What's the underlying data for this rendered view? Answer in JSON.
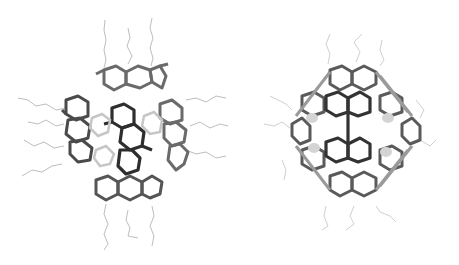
{
  "figure": {
    "background": "#ffffff",
    "panels": [
      {
        "id": "left",
        "description": "Molecular cage stick model, side view with alkyl chains",
        "bond_color_dark": "#3a3a3a",
        "bond_color_mid": "#7a7a7a",
        "chain_color": "#b8b8b8"
      },
      {
        "id": "right",
        "description": "Molecular cage stick model, rotated view with fused hexagonal rings",
        "bond_color_dark": "#3a3a3a",
        "bond_color_mid": "#7a7a7a",
        "chain_color": "#c8c8c8"
      }
    ]
  }
}
